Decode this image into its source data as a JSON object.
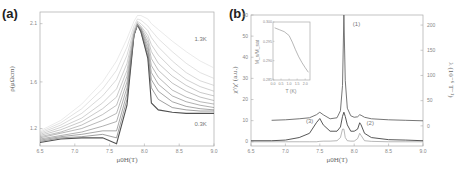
{
  "figure": {
    "panel_a_label": "(a)",
    "panel_b_label": "(b)"
  },
  "chart_data": [
    {
      "type": "line",
      "panel": "(a)",
      "title": "",
      "xlabel": "μ0H(T)",
      "ylabel": "ρ(μΩcm)",
      "xlim": [
        6.5,
        9.0
      ],
      "ylim": [
        1.05,
        2.2
      ],
      "xticks": [
        "6.5",
        "7.0",
        "7.5",
        "8.0",
        "8.5",
        "9.0"
      ],
      "yticks": [
        "1.2",
        "1.6",
        "2.1"
      ],
      "ytick_values": [
        1.2,
        1.6,
        2.1
      ],
      "annotations": [
        {
          "text": "1.3K",
          "x": 8.72,
          "y": 1.95
        },
        {
          "text": "0.3K",
          "x": 8.72,
          "y": 1.22
        }
      ],
      "legend": "none",
      "grid": false,
      "x": [
        6.5,
        6.8,
        7.1,
        7.4,
        7.6,
        7.75,
        7.85,
        7.9,
        7.95,
        8.05,
        8.1,
        8.2,
        8.4,
        8.6,
        8.8,
        9.0
      ],
      "series": [
        {
          "name": "0.3K",
          "values": [
            1.08,
            1.11,
            1.12,
            1.12,
            1.07,
            1.4,
            2.0,
            2.09,
            2.03,
            1.8,
            1.42,
            1.36,
            1.34,
            1.33,
            1.33,
            1.33
          ]
        },
        {
          "name": "0.4K",
          "values": [
            1.09,
            1.12,
            1.13,
            1.15,
            1.12,
            1.45,
            2.0,
            2.09,
            2.03,
            1.82,
            1.55,
            1.45,
            1.38,
            1.36,
            1.35,
            1.35
          ]
        },
        {
          "name": "0.5K",
          "values": [
            1.1,
            1.13,
            1.15,
            1.18,
            1.18,
            1.5,
            2.0,
            2.09,
            2.04,
            1.85,
            1.62,
            1.52,
            1.43,
            1.39,
            1.37,
            1.36
          ]
        },
        {
          "name": "0.6K",
          "values": [
            1.11,
            1.14,
            1.17,
            1.22,
            1.26,
            1.55,
            2.0,
            2.09,
            2.05,
            1.88,
            1.68,
            1.58,
            1.48,
            1.43,
            1.4,
            1.38
          ]
        },
        {
          "name": "0.7K",
          "values": [
            1.12,
            1.16,
            1.2,
            1.27,
            1.33,
            1.6,
            2.0,
            2.09,
            2.06,
            1.91,
            1.74,
            1.64,
            1.53,
            1.47,
            1.43,
            1.41
          ]
        },
        {
          "name": "0.8K",
          "values": [
            1.13,
            1.17,
            1.23,
            1.32,
            1.4,
            1.65,
            2.01,
            2.09,
            2.06,
            1.94,
            1.8,
            1.7,
            1.59,
            1.52,
            1.47,
            1.44
          ]
        },
        {
          "name": "0.9K",
          "values": [
            1.14,
            1.19,
            1.26,
            1.37,
            1.47,
            1.7,
            2.02,
            2.1,
            2.07,
            1.97,
            1.86,
            1.76,
            1.65,
            1.57,
            1.51,
            1.48
          ]
        },
        {
          "name": "1.0K",
          "values": [
            1.15,
            1.21,
            1.29,
            1.42,
            1.54,
            1.76,
            2.03,
            2.11,
            2.08,
            2.0,
            1.92,
            1.83,
            1.71,
            1.62,
            1.56,
            1.52
          ]
        },
        {
          "name": "1.1K",
          "values": [
            1.16,
            1.23,
            1.33,
            1.48,
            1.62,
            1.83,
            2.05,
            2.12,
            2.1,
            2.04,
            1.98,
            1.9,
            1.78,
            1.68,
            1.61,
            1.57
          ]
        },
        {
          "name": "1.2K",
          "values": [
            1.17,
            1.25,
            1.37,
            1.54,
            1.7,
            1.9,
            2.08,
            2.14,
            2.13,
            2.08,
            2.04,
            1.97,
            1.86,
            1.76,
            1.68,
            1.63
          ]
        },
        {
          "name": "1.3K",
          "values": [
            1.18,
            1.27,
            1.41,
            1.6,
            1.78,
            1.97,
            2.12,
            2.17,
            2.17,
            2.14,
            2.1,
            2.05,
            1.95,
            1.86,
            1.78,
            1.72
          ]
        }
      ]
    },
    {
      "type": "line",
      "panel": "(b)",
      "title": "",
      "xlabel": "μ0H(T)",
      "ylabel": "χ'/χ' (a.u.)",
      "ylabel_right": "λ (10⁻⁶ T⁻¹)",
      "xlim": [
        6.5,
        9.0
      ],
      "ylim": [
        -2,
        60
      ],
      "ylim_right": [
        -40,
        220
      ],
      "xticks": [
        "6.5",
        "7.0",
        "7.5",
        "8.0",
        "8.5",
        "9.0"
      ],
      "yticks": [
        "0",
        "10",
        "20",
        "30",
        "40",
        "50",
        "60"
      ],
      "yticks_right": [
        "0",
        "50",
        "100",
        "150",
        "200"
      ],
      "annotations": [
        {
          "text": "(1)",
          "x": 7.98,
          "y": 55
        },
        {
          "text": "(2)",
          "x": 8.18,
          "y": 8
        },
        {
          "text": "(3)",
          "x": 7.3,
          "y": 9
        }
      ],
      "legend": "none",
      "grid": false,
      "x": [
        6.5,
        6.8,
        7.0,
        7.2,
        7.35,
        7.45,
        7.5,
        7.55,
        7.65,
        7.75,
        7.8,
        7.83,
        7.85,
        7.87,
        7.9,
        7.95,
        8.0,
        8.05,
        8.08,
        8.1,
        8.15,
        8.25,
        8.5,
        8.75,
        9.0
      ],
      "series": [
        {
          "name": "(1) λ (right axis)",
          "axis": "right",
          "values": [
            null,
            11,
            12,
            14,
            16,
            22,
            27,
            22,
            14,
            16,
            30,
            80,
            220,
            90,
            35,
            20,
            17,
            18,
            22,
            21,
            17,
            14,
            12,
            11,
            10
          ]
        },
        {
          "name": "(3) χ'",
          "axis": "left",
          "values": [
            0.5,
            0.5,
            0.8,
            2,
            4,
            9,
            11,
            8,
            5,
            5,
            7,
            12,
            14,
            12,
            8,
            5,
            5,
            6,
            9,
            8,
            4,
            2,
            1,
            0.8,
            0.5
          ]
        },
        {
          "name": "(2) χ''",
          "axis": "left",
          "values": [
            0,
            0,
            0,
            0,
            0,
            0,
            0.2,
            0.3,
            0.3,
            0.5,
            2,
            6,
            6,
            2,
            0.5,
            0.3,
            0.3,
            1.5,
            4,
            3,
            0.5,
            0.2,
            0,
            0,
            0
          ]
        }
      ],
      "inset": {
        "type": "line",
        "xlabel": "T (K)",
        "ylabel": "M_s/M_sat",
        "xlim": [
          0.0,
          2.3
        ],
        "ylim": [
          0.285,
          0.3
        ],
        "xticks": [
          "0.0",
          "0.5",
          "1.0",
          "1.5",
          "2.0"
        ],
        "yticks": [
          "0.285",
          "0.290",
          "0.295",
          "0.300"
        ],
        "x": [
          0.1,
          0.4,
          0.7,
          1.0,
          1.2,
          1.4,
          1.6,
          1.8,
          2.0,
          2.2
        ],
        "values": [
          0.2985,
          0.298,
          0.2975,
          0.2965,
          0.2948,
          0.2928,
          0.291,
          0.2895,
          0.2882,
          0.287
        ]
      }
    }
  ]
}
